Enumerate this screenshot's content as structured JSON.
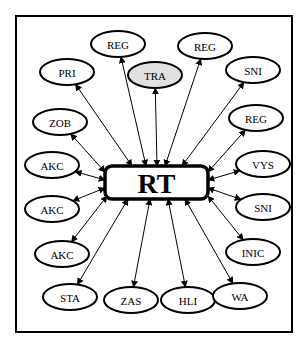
{
  "diagram": {
    "frame": {
      "x": 16,
      "y": 16,
      "width": 276,
      "height": 316
    },
    "center": {
      "id": "rt",
      "label": "RT",
      "x": 105,
      "y": 166,
      "width": 103,
      "height": 33
    },
    "colors": {
      "stroke": "#000000",
      "background": "#ffffff",
      "highlight_fill": "#e0e0e0"
    },
    "nodes": [
      {
        "id": "reg-1",
        "label": "REG",
        "cx": 118,
        "cy": 44,
        "rx": 27,
        "ry": 13,
        "highlight": false
      },
      {
        "id": "reg-2",
        "label": "REG",
        "cx": 205,
        "cy": 46,
        "rx": 27,
        "ry": 13,
        "highlight": false
      },
      {
        "id": "pri",
        "label": "PRI",
        "cx": 67,
        "cy": 72,
        "rx": 27,
        "ry": 13,
        "highlight": false
      },
      {
        "id": "tra",
        "label": "TRA",
        "cx": 155,
        "cy": 75,
        "rx": 27,
        "ry": 13,
        "highlight": true
      },
      {
        "id": "sni-1",
        "label": "SNI",
        "cx": 253,
        "cy": 70,
        "rx": 27,
        "ry": 13,
        "highlight": false
      },
      {
        "id": "zob",
        "label": "ZOB",
        "cx": 60,
        "cy": 122,
        "rx": 27,
        "ry": 13,
        "highlight": false
      },
      {
        "id": "reg-3",
        "label": "REG",
        "cx": 256,
        "cy": 118,
        "rx": 27,
        "ry": 13,
        "highlight": false
      },
      {
        "id": "akc-1",
        "label": "AKC",
        "cx": 52,
        "cy": 165,
        "rx": 27,
        "ry": 13,
        "highlight": false
      },
      {
        "id": "vys",
        "label": "VYS",
        "cx": 263,
        "cy": 164,
        "rx": 27,
        "ry": 13,
        "highlight": false
      },
      {
        "id": "akc-2",
        "label": "AKC",
        "cx": 52,
        "cy": 209,
        "rx": 27,
        "ry": 13,
        "highlight": false
      },
      {
        "id": "sni-2",
        "label": "SNI",
        "cx": 263,
        "cy": 207,
        "rx": 27,
        "ry": 13,
        "highlight": false
      },
      {
        "id": "akc-3",
        "label": "AKC",
        "cx": 62,
        "cy": 254,
        "rx": 27,
        "ry": 13,
        "highlight": false
      },
      {
        "id": "inic",
        "label": "INIC",
        "cx": 253,
        "cy": 252,
        "rx": 27,
        "ry": 13,
        "highlight": false
      },
      {
        "id": "sta",
        "label": "STA",
        "cx": 70,
        "cy": 297,
        "rx": 27,
        "ry": 13,
        "highlight": false
      },
      {
        "id": "zas",
        "label": "ZAS",
        "cx": 131,
        "cy": 300,
        "rx": 27,
        "ry": 13,
        "highlight": false
      },
      {
        "id": "hli",
        "label": "HLI",
        "cx": 188,
        "cy": 300,
        "rx": 27,
        "ry": 13,
        "highlight": false
      },
      {
        "id": "wa",
        "label": "WA",
        "cx": 240,
        "cy": 296,
        "rx": 27,
        "ry": 13,
        "highlight": false
      }
    ],
    "edges": [
      {
        "node": "reg-1",
        "anchor": [
          146,
          166
        ],
        "both": true
      },
      {
        "node": "reg-2",
        "anchor": [
          165,
          166
        ],
        "both": true
      },
      {
        "node": "pri",
        "anchor": [
          132,
          166
        ],
        "both": true
      },
      {
        "node": "tra",
        "anchor": [
          157,
          166
        ],
        "both": true
      },
      {
        "node": "sni-1",
        "anchor": [
          182,
          166
        ],
        "both": true
      },
      {
        "node": "zob",
        "anchor": [
          105,
          172
        ],
        "both": true
      },
      {
        "node": "reg-3",
        "anchor": [
          208,
          172
        ],
        "both": true
      },
      {
        "node": "akc-1",
        "anchor": [
          105,
          180
        ],
        "both": true
      },
      {
        "node": "vys",
        "anchor": [
          208,
          180
        ],
        "both": true
      },
      {
        "node": "akc-2",
        "anchor": [
          105,
          188
        ],
        "both": true
      },
      {
        "node": "sni-2",
        "anchor": [
          208,
          188
        ],
        "both": true
      },
      {
        "node": "akc-3",
        "anchor": [
          107,
          196
        ],
        "both": true
      },
      {
        "node": "inic",
        "anchor": [
          208,
          196
        ],
        "both": true
      },
      {
        "node": "sta",
        "anchor": [
          128,
          199
        ],
        "both": true
      },
      {
        "node": "zas",
        "anchor": [
          150,
          199
        ],
        "both": true
      },
      {
        "node": "hli",
        "anchor": [
          168,
          199
        ],
        "both": true
      },
      {
        "node": "wa",
        "anchor": [
          185,
          199
        ],
        "both": true
      }
    ]
  }
}
